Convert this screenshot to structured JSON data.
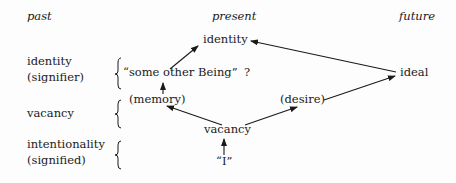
{
  "headers": {
    "past": "past",
    "present": "present",
    "future": "future"
  },
  "rows": {
    "identity": {
      "label_line1": "identity",
      "label_line2": "(signifier)"
    },
    "vacancy": {
      "label": "vacancy"
    },
    "intentionality": {
      "label_line1": "intentionality",
      "label_line2": "(signified)"
    }
  },
  "nodes": {
    "identity_present": "identity",
    "some_other_being": "“some other Being”",
    "question": "?",
    "ideal": "ideal",
    "memory": "(memory)",
    "desire": "(desire)",
    "vacancy_center": "vacancy",
    "i": "“I”"
  },
  "edges": [
    {
      "from": "some_other_being",
      "to": "identity_present"
    },
    {
      "from": "ideal",
      "to": "identity_present"
    },
    {
      "from": "memory",
      "to": "some_other_being"
    },
    {
      "from": "vacancy_center",
      "to": "memory"
    },
    {
      "from": "vacancy_center",
      "to": "desire"
    },
    {
      "from": "desire",
      "to": "ideal"
    },
    {
      "from": "i",
      "to": "vacancy_center"
    }
  ],
  "colors": {
    "ink": "#1a1a1a",
    "background": "#fdfdfd"
  }
}
